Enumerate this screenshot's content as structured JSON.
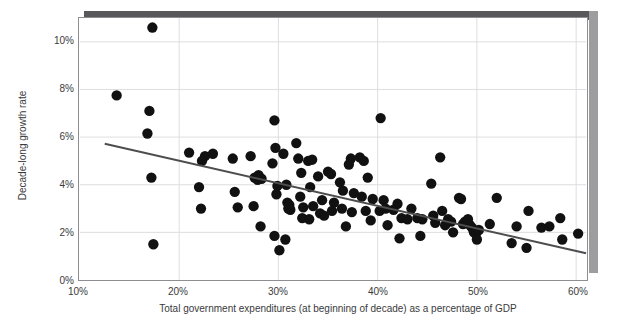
{
  "chart_data": {
    "type": "scatter",
    "title": "",
    "xlabel": "Total government expenditures (at beginning of decade) as a percentage of GDP",
    "ylabel": "Decade-long growth rate",
    "xlim": [
      10,
      61
    ],
    "ylim": [
      0,
      11
    ],
    "xticks": [
      10,
      20,
      30,
      40,
      50,
      60
    ],
    "yticks": [
      0,
      2,
      4,
      6,
      8,
      10
    ],
    "xticklabels": [
      "10%",
      "20%",
      "30%",
      "40%",
      "50%",
      "60%"
    ],
    "yticklabels": [
      "0%",
      "2%",
      "4%",
      "6%",
      "8%",
      "10%"
    ],
    "grid": true,
    "legend": null,
    "marker_color": "#111111",
    "marker_size": 5.2,
    "trendline": {
      "type": "linear",
      "color": "#4d4d4f",
      "width": 2,
      "x_start": 12.5,
      "y_start": 5.72,
      "x_end": 61.0,
      "y_end": 1.12
    },
    "points": [
      {
        "x": 17.3,
        "y": 10.6
      },
      {
        "x": 13.7,
        "y": 7.75
      },
      {
        "x": 17.0,
        "y": 7.1
      },
      {
        "x": 16.8,
        "y": 6.15
      },
      {
        "x": 17.2,
        "y": 4.3
      },
      {
        "x": 17.4,
        "y": 1.5
      },
      {
        "x": 21.0,
        "y": 5.35
      },
      {
        "x": 22.6,
        "y": 5.2
      },
      {
        "x": 22.3,
        "y": 5.0
      },
      {
        "x": 23.4,
        "y": 5.3
      },
      {
        "x": 22.0,
        "y": 3.9
      },
      {
        "x": 22.2,
        "y": 3.0
      },
      {
        "x": 25.4,
        "y": 5.1
      },
      {
        "x": 25.6,
        "y": 3.7
      },
      {
        "x": 25.9,
        "y": 3.05
      },
      {
        "x": 27.2,
        "y": 5.2
      },
      {
        "x": 27.6,
        "y": 4.3
      },
      {
        "x": 27.9,
        "y": 4.2
      },
      {
        "x": 28.3,
        "y": 4.25
      },
      {
        "x": 28.0,
        "y": 4.4
      },
      {
        "x": 27.5,
        "y": 3.1
      },
      {
        "x": 28.2,
        "y": 2.25
      },
      {
        "x": 29.6,
        "y": 6.7
      },
      {
        "x": 29.7,
        "y": 5.55
      },
      {
        "x": 29.4,
        "y": 4.9
      },
      {
        "x": 29.8,
        "y": 3.6
      },
      {
        "x": 29.9,
        "y": 3.95
      },
      {
        "x": 29.6,
        "y": 1.85
      },
      {
        "x": 30.1,
        "y": 1.25
      },
      {
        "x": 30.5,
        "y": 5.3
      },
      {
        "x": 30.8,
        "y": 4.0
      },
      {
        "x": 30.9,
        "y": 3.25
      },
      {
        "x": 31.0,
        "y": 3.0
      },
      {
        "x": 31.2,
        "y": 2.95
      },
      {
        "x": 31.1,
        "y": 3.15
      },
      {
        "x": 30.7,
        "y": 1.7
      },
      {
        "x": 31.8,
        "y": 5.75
      },
      {
        "x": 32.0,
        "y": 5.1
      },
      {
        "x": 32.3,
        "y": 4.5
      },
      {
        "x": 32.2,
        "y": 3.5
      },
      {
        "x": 32.5,
        "y": 3.05
      },
      {
        "x": 32.4,
        "y": 2.6
      },
      {
        "x": 33.0,
        "y": 5.0
      },
      {
        "x": 33.4,
        "y": 5.05
      },
      {
        "x": 33.2,
        "y": 3.9
      },
      {
        "x": 33.5,
        "y": 3.1
      },
      {
        "x": 33.1,
        "y": 2.55
      },
      {
        "x": 34.0,
        "y": 4.35
      },
      {
        "x": 34.4,
        "y": 3.35
      },
      {
        "x": 34.2,
        "y": 2.8
      },
      {
        "x": 34.6,
        "y": 2.7
      },
      {
        "x": 35.0,
        "y": 4.55
      },
      {
        "x": 35.3,
        "y": 4.45
      },
      {
        "x": 35.6,
        "y": 3.25
      },
      {
        "x": 35.4,
        "y": 2.9
      },
      {
        "x": 36.2,
        "y": 4.1
      },
      {
        "x": 36.5,
        "y": 3.75
      },
      {
        "x": 36.4,
        "y": 3.0
      },
      {
        "x": 36.8,
        "y": 2.25
      },
      {
        "x": 37.3,
        "y": 5.1
      },
      {
        "x": 37.1,
        "y": 4.85
      },
      {
        "x": 37.6,
        "y": 3.65
      },
      {
        "x": 37.4,
        "y": 2.85
      },
      {
        "x": 38.2,
        "y": 5.15
      },
      {
        "x": 38.6,
        "y": 5.0
      },
      {
        "x": 38.4,
        "y": 3.5
      },
      {
        "x": 38.8,
        "y": 2.9
      },
      {
        "x": 39.0,
        "y": 4.3
      },
      {
        "x": 39.5,
        "y": 3.4
      },
      {
        "x": 39.3,
        "y": 2.5
      },
      {
        "x": 40.3,
        "y": 6.8
      },
      {
        "x": 40.6,
        "y": 3.35
      },
      {
        "x": 40.2,
        "y": 2.9
      },
      {
        "x": 40.8,
        "y": 3.0
      },
      {
        "x": 41.0,
        "y": 2.3
      },
      {
        "x": 41.6,
        "y": 2.95
      },
      {
        "x": 42.0,
        "y": 3.2
      },
      {
        "x": 42.4,
        "y": 2.6
      },
      {
        "x": 42.2,
        "y": 1.75
      },
      {
        "x": 43.4,
        "y": 3.0
      },
      {
        "x": 43.0,
        "y": 2.55
      },
      {
        "x": 44.0,
        "y": 2.6
      },
      {
        "x": 44.5,
        "y": 2.55
      },
      {
        "x": 44.3,
        "y": 1.85
      },
      {
        "x": 45.4,
        "y": 4.05
      },
      {
        "x": 45.6,
        "y": 2.7
      },
      {
        "x": 45.8,
        "y": 2.4
      },
      {
        "x": 46.3,
        "y": 5.15
      },
      {
        "x": 46.5,
        "y": 2.9
      },
      {
        "x": 46.8,
        "y": 2.3
      },
      {
        "x": 47.1,
        "y": 2.55
      },
      {
        "x": 47.4,
        "y": 2.45
      },
      {
        "x": 47.6,
        "y": 2.0
      },
      {
        "x": 48.2,
        "y": 3.45
      },
      {
        "x": 48.4,
        "y": 3.4
      },
      {
        "x": 48.6,
        "y": 2.35
      },
      {
        "x": 48.8,
        "y": 2.45
      },
      {
        "x": 49.1,
        "y": 2.55
      },
      {
        "x": 49.3,
        "y": 2.3
      },
      {
        "x": 49.5,
        "y": 2.2
      },
      {
        "x": 49.7,
        "y": 2.0
      },
      {
        "x": 49.9,
        "y": 1.95
      },
      {
        "x": 50.2,
        "y": 2.1
      },
      {
        "x": 50.0,
        "y": 1.7
      },
      {
        "x": 51.3,
        "y": 2.35
      },
      {
        "x": 52.0,
        "y": 3.45
      },
      {
        "x": 53.5,
        "y": 1.55
      },
      {
        "x": 54.0,
        "y": 2.25
      },
      {
        "x": 55.2,
        "y": 2.9
      },
      {
        "x": 55.0,
        "y": 1.35
      },
      {
        "x": 56.5,
        "y": 2.2
      },
      {
        "x": 57.3,
        "y": 2.25
      },
      {
        "x": 58.4,
        "y": 2.6
      },
      {
        "x": 58.6,
        "y": 1.7
      },
      {
        "x": 60.2,
        "y": 1.95
      }
    ]
  },
  "axes": {
    "y_title": "Decade-long growth rate",
    "x_title": "Total government expenditures (at beginning of decade) as a percentage of GDP"
  }
}
